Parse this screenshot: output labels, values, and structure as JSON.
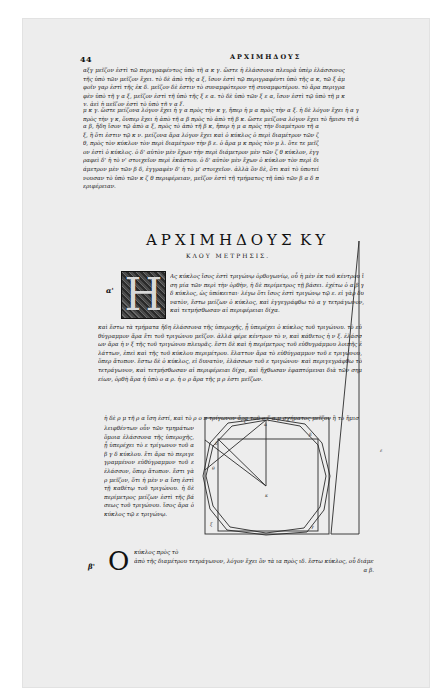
{
  "page": {
    "folio": "44",
    "running_head": "ΑΡΧΙΜΗΔΟΥΣ",
    "top_text": {
      "lines_a": "αξγ μεῖζον ἐστὶ τῶ περιγραφέντος ὑπὸ τῆ α κ γ. ὥστε ἡ ἐλάσσονα πλευρὰ ὑπὲρ ἐλάσσονος τῆς ὑπὸ τῶν μεῖζον ἔχει. τὸ δὲ ἀπὸ τῆς α ξ, ἴσον ἐστὶ τῷ περιγραφέντι ὑπὸ τῆς α κ, τῶ ξ ἀμφοῖν γαρ ἐστὶ τῆς ἐκ δ. μεῖζον δὲ ἐστιν τὸ συναμφότερον τῆ συναμφοτέρου. τὸ ἄρα περιγραφὲν ὑπὸ τῆ γ α ξ, μεῖζον ἐστὶ τῆ ὑπὸ τῆς ξ ε α. τὸ δὲ ὑπὸ τῶν ξ ε α, ἴσον ἐστὶ τῷ ὑπὸ τῆ μ κ γ. ἀεὶ ἡ μεῖζον ἐστὶ τὸ ὑπὸ τῆ γ α ξ.",
      "lines_b": "μ κ γ. ὥστε μείζονα λόγον ἔχει ἡ γ α πρὸς τὴν κ γ, ἤπερ ἡ μ α πρὸς τὴν α ξ. ἡ δὲ λόγον ἔχει ἡ α γ πρὸς τὴν γ κ, ὅνπερ ἔχει ἡ ἀπὸ τῆ α β πρὸς τὸ ἀπὸ τῆ β κ. ὥστε μείζονα λόγον ἔχει τὸ ἤμισυ τῆ ἀπὸ",
      "lines_c": "α β, ἤδη ἴσον τῷ ἀπὸ α ξ, πρὸς τὸ ἀπὸ τῆ β κ, ἤπερ ἡ μ α πρὸς τὴν διαμέτρου τῆ α ξ, ἢ ὅτι ἐστιν τῷ κ ν. μείζονα ἄρα λόγον ἔχει καὶ ὁ κύκλος ὁ περὶ διαμέτρον τῶν ζ θ, πρὸς τὸν κύκλον τὸν περὶ διαμέτρον τὴν β ε. ὁ ἄρα μ κ πρὸς τὸν μ λ. ὅτε τε μεῖζον ἐστὶ ὁ κύκλος. ὁ δ' αὐτὸν μὲν ἔχων τὴν περὶ διάμετρον μὲν τῶν ζ θ κύκλον, ἐγγραφεὶ δ' ἡ τὸ ν' στοιχεῖον περὶ ἑκάστου. ὁ δ' αὐτὸν μὲν ἔχων ὁ κύκλον τὸν περὶ διάμετρον μὲν τῶν β δ, ἐγγραφὲν δ' ἡ τὸ μ' στοιχεῖον. ἀλλὰ ὃν δὲ, ὅτι καὶ τὸ ὑποτείνουσαν τὸ ὑπὸ τῶν κ ζ θ περιφέρειαν, μεῖζον ἐστὶ τῆ τμήματος τῆ ὑπὸ τῶν β α δ περιφέρειαν."
    },
    "title": {
      "line1_left": "ΑΡΧΙΜΗΔΟΥΣ",
      "line1_right": "ΚΥ",
      "line2": "ΚΛΟΥ ΜΕΤΡΗΣΙΣ."
    },
    "section_a": {
      "margin_mark": "α'",
      "drop_cap": "Η",
      "text_beside_cap": "Ας κύκλος ἴσος ἐστὶ τριγώνῳ ὀρθογωνίῳ, οὗ ἡ μὲν ἐκ τοῦ κέντρου ἴση μία τῶν περὶ τὴν ὀρθὴν, ἡ δὲ περίμετρος τῇ βάσει. ἐχέτω ὁ α β γ δ κύκλος, ὡς ὑπόκειται· λέγω ὅτι ἴσος ἐστὶ τριγώνῳ τῷ ε. εἰ γὰρ δυνατὸν, ἔστω μείζων ὁ κύκλος, καὶ ἐγγεγράφθω τὸ α γ τετράγωνον, καὶ τετμήσθωσαν αἱ περιφέρειαι δίχα.",
      "text_full_width": "καὶ ἔστω τὰ τμήματα ἤδη ἐλάσσονα τῆς ὑπεροχῆς, ᾗ ὑπερέχει ὁ κύκλος τοῦ τριγώνου. τὸ εὐθύγραμμον ἄρα ἔτι τοῦ τριγώνου μεῖζον. ἀλλά φέρε κέντρον τὸ ν, καὶ κάθετος ἡ ν ξ. ἐλάσσων ἄρα ἡ ν ξ τῆς τοῦ τριγώνου πλευρᾶς. ἔστι δὲ καὶ ἡ περίμετρος τοῦ εὐθυγράμμου λοιπῆς ἐλάττων, ἐπεὶ καὶ τῆς τοῦ κύκλου περιμέτρου. ἔλαττον ἄρα τὸ εὐθύγραμμον τοῦ ε τριγώνου, ὅπερ ἄτοπον. ἔστω δὲ ὁ κύκλος, εἰ δυνατὸν, ἐλάσσων τοῦ ε τριγώνου· καὶ περιγεγράφθω τὸ τετράγωνον, καὶ τετμήσθωσαν αἱ περιφέρειαι δίχα, καὶ ἤχθωσαν ἐφαπτόμεναι διὰ τῶν σημείων, ὀρθὴ ἄρα ἡ ὑπὸ ο α ρ. ἡ ο ρ ἄρα τῆς μ ρ ἐστι μεῖζων.",
      "text_short_line": "ἡ δὲ ρ μ τῆ ρ α ἴση ἐστί, καὶ τὸ ρ ο π τρίγωνον ἄρα τοῦ ο ζ α μ σχήματος μεῖζον ἢ τὸ ἥμισυ. λα",
      "text_narrow_column": "λειφθέντων οὖν τῶν τμημάτων ὅμοια ἐλάσσονα τῆς ὑπεροχῆς, ᾗ ὑπερέχει τὸ ε τρίγωνον τοῦ α β γ δ κύκλου. ἔτι ἄρα τὸ περιγεγραμμένον εὐθύγραμμον τοῦ ε ἐλάσσον, ὅπερ ἄτοπον. ἔστι γὰρ μεῖζον, ὅτι ἡ μὲν ν α ἴση ἐστὶ τῇ καθέτῳ τοῦ τριγώνου. ἡ δὲ περίμετρος μείζων ἐστὶ τῆς βάσεως τοῦ τριγώνου. ἴσος ἄρα ὁ κύκλος τῷ ε τριγώνῳ."
    },
    "section_b": {
      "margin_mark": "β'",
      "drop_cap": "Ο",
      "line1": "κύκλος πρὸς τὸ",
      "line2": "ἀπὸ τῆς διαμέτρου τετράγωνον, λόγον ἔχει ὃν τὰ ια πρὸς ιδ. ἔστω κύκλος, οὗ διάμετρος ἡ",
      "line3": "α β."
    },
    "diagram": {
      "labels": [
        "α",
        "β",
        "γ",
        "δ",
        "ε",
        "ζ",
        "θ",
        "κ",
        "ν",
        "ξ"
      ],
      "ink_color": "#2a2a2a"
    },
    "colors": {
      "paper": "#ededed",
      "ink": "#111111",
      "background": "#ffffff"
    }
  }
}
